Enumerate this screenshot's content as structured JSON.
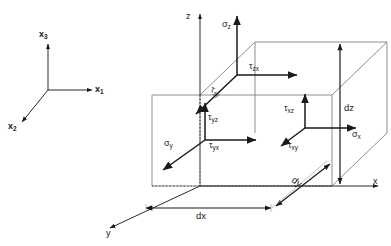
{
  "figure": {
    "background_color": "#ffffff",
    "line_color": "#1a1a1a",
    "faint_line_color": "#9a9a9a"
  },
  "reference_axes": {
    "name": "index-notation-axes",
    "axis_x1_label": "x",
    "axis_x1_sub": "1",
    "axis_x2_label": "x",
    "axis_x2_sub": "2",
    "axis_x3_label": "x",
    "axis_x3_sub": "3"
  },
  "cube_axes": {
    "axis_x_label": "x",
    "axis_y_label": "y",
    "axis_z_label": "z"
  },
  "stresses": {
    "top_face": {
      "normal_label": "σ",
      "normal_sub": "z",
      "shear_1_label": "τ",
      "shear_1_sub": "zx",
      "shear_2_label": "τ",
      "shear_2_sub": "zy"
    },
    "left_face": {
      "normal_label": "σ",
      "normal_sub": "y",
      "shear_1_label": "τ",
      "shear_1_sub": "yz",
      "shear_2_label": "τ",
      "shear_2_sub": "yx"
    },
    "right_face": {
      "normal_label": "σ",
      "normal_sub": "x",
      "shear_1_label": "τ",
      "shear_1_sub": "xz",
      "shear_2_label": "τ",
      "shear_2_sub": "xy"
    }
  },
  "dimensions": {
    "width_label": "dx",
    "depth_label": "dy",
    "height_label": "dz"
  }
}
